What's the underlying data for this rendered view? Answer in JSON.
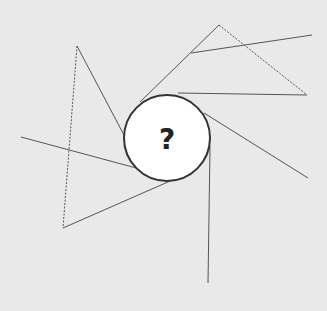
{
  "diagram": {
    "type": "puzzle-figure",
    "background": "#e9e9e9",
    "stroke_color": "#555555",
    "center_circle": {
      "cx": 167,
      "cy": 138,
      "r": 43,
      "fill": "#ffffff",
      "stroke": "#333333",
      "label": "?"
    },
    "solid_lines": [
      {
        "x1": 77,
        "y1": 46,
        "x2": 125,
        "y2": 137
      },
      {
        "x1": 21,
        "y1": 137,
        "x2": 140,
        "y2": 169
      },
      {
        "x1": 63,
        "y1": 228,
        "x2": 177,
        "y2": 178
      },
      {
        "x1": 140,
        "y1": 102,
        "x2": 219,
        "y2": 25
      },
      {
        "x1": 191,
        "y1": 53,
        "x2": 312,
        "y2": 35
      },
      {
        "x1": 178,
        "y1": 93,
        "x2": 307,
        "y2": 95
      },
      {
        "x1": 204,
        "y1": 113,
        "x2": 308,
        "y2": 178
      },
      {
        "x1": 210,
        "y1": 147,
        "x2": 208,
        "y2": 283
      }
    ],
    "dashed_lines": [
      {
        "x1": 77,
        "y1": 46,
        "x2": 63,
        "y2": 228
      },
      {
        "x1": 219,
        "y1": 25,
        "x2": 307,
        "y2": 95
      }
    ]
  }
}
